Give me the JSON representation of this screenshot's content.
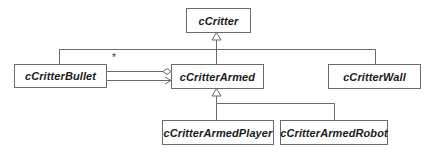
{
  "diagram": {
    "type": "UML class diagram",
    "classes": [
      {
        "id": "cCritter",
        "label": "cCritter"
      },
      {
        "id": "cCritterBullet",
        "label": "cCritterBullet"
      },
      {
        "id": "cCritterArmed",
        "label": "cCritterArmed"
      },
      {
        "id": "cCritterWall",
        "label": "cCritterWall"
      },
      {
        "id": "cCritterArmedPlayer",
        "label": "cCritterArmedPlayer"
      },
      {
        "id": "cCritterArmedRobot",
        "label": "cCritterArmedRobot"
      }
    ],
    "relationships": [
      {
        "kind": "generalization",
        "from": "cCritterBullet",
        "to": "cCritter"
      },
      {
        "kind": "generalization",
        "from": "cCritterArmed",
        "to": "cCritter"
      },
      {
        "kind": "generalization",
        "from": "cCritterWall",
        "to": "cCritter"
      },
      {
        "kind": "generalization",
        "from": "cCritterArmedPlayer",
        "to": "cCritterArmed"
      },
      {
        "kind": "generalization",
        "from": "cCritterArmedRobot",
        "to": "cCritterArmed"
      },
      {
        "kind": "aggregation",
        "whole": "cCritterArmed",
        "part": "cCritterBullet",
        "multiplicity": "*"
      },
      {
        "kind": "association",
        "from": "cCritterBullet",
        "to": "cCritterArmed",
        "navigable": true
      }
    ],
    "multiplicity_label": "*"
  },
  "colors": {
    "line": "#6b6b6b",
    "text": "#1a1a1a",
    "background": "#ffffff"
  }
}
